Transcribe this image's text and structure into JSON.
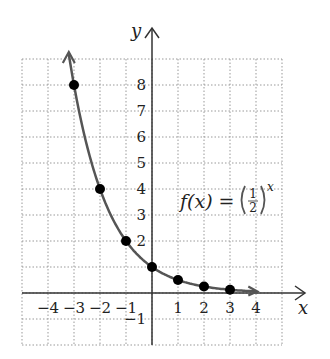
{
  "chart_data": {
    "type": "line",
    "title": "",
    "function_label": {
      "prefix": "f(x) = ",
      "numerator": "1",
      "denominator": "2",
      "exponent": "x"
    },
    "xlabel": "x",
    "ylabel": "y",
    "xlim": [
      -5,
      5
    ],
    "ylim": [
      -2,
      9
    ],
    "x_ticks": [
      -4,
      -3,
      -2,
      -1,
      1,
      2,
      3,
      4
    ],
    "x_tick_labels": [
      "−4",
      "−3",
      "−2",
      "−1",
      "1",
      "2",
      "3",
      "4"
    ],
    "y_ticks": [
      -1,
      2,
      3,
      4,
      5,
      6,
      7,
      8
    ],
    "y_tick_labels": [
      "−1",
      "2",
      "3",
      "4",
      "5",
      "6",
      "7",
      "8"
    ],
    "grid": true,
    "series": [
      {
        "name": "f(x) = (1/2)^x",
        "points": [
          {
            "x": -3,
            "y": 8
          },
          {
            "x": -2,
            "y": 4
          },
          {
            "x": -1,
            "y": 2
          },
          {
            "x": 0,
            "y": 1
          },
          {
            "x": 1,
            "y": 0.5
          },
          {
            "x": 2,
            "y": 0.25
          },
          {
            "x": 3,
            "y": 0.125
          }
        ]
      }
    ]
  },
  "colors": {
    "curve": "#555555",
    "axis": "#333333",
    "grid": "#999999",
    "point": "#000000"
  }
}
